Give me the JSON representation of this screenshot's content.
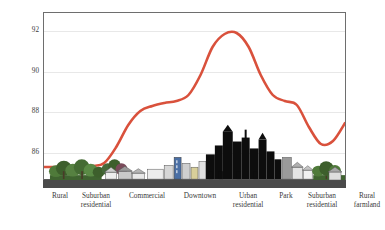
{
  "chart_data": {
    "type": "line",
    "title": "",
    "xlabel": "",
    "ylabel": "Late afternoon temperature (°F)",
    "ylim": [
      84.2,
      92.9
    ],
    "yticks": [
      86,
      88,
      90,
      92
    ],
    "ytick_labels": [
      "86",
      "88",
      "90",
      "92"
    ],
    "grid": true,
    "legend": "none",
    "line_color": "#d9513c",
    "categories": [
      "Rural",
      "Suburban residential",
      "Commercial",
      "Downtown",
      "Urban residential",
      "Park",
      "Suburban residential",
      "Rural farmland"
    ],
    "values": [
      85.2,
      88.3,
      88.6,
      91.9,
      88.5,
      86.3,
      88.1,
      85.2
    ],
    "series": [
      {
        "name": "Late afternoon temperature",
        "x": [
          0,
          4,
          8,
          12,
          16,
          20,
          24,
          28,
          32,
          36,
          40,
          44,
          48,
          52,
          56,
          60,
          64,
          68,
          72,
          76,
          80,
          84,
          88,
          92,
          96,
          100
        ],
        "values": [
          85.2,
          85.2,
          85.2,
          85.2,
          85.25,
          85.4,
          86.2,
          87.3,
          88.0,
          88.25,
          88.4,
          88.5,
          88.8,
          89.8,
          91.2,
          91.85,
          91.9,
          91.2,
          89.8,
          88.8,
          88.5,
          88.3,
          87.2,
          86.35,
          86.5,
          87.4
        ]
      }
    ],
    "annotations": {
      "illustration": "street-profile cross-section: rural trees, suburban houses, commercial low-rise, downtown skyline silhouette, urban residential, park trees, suburban houses, rural farmland hills"
    }
  },
  "axis": {
    "y_title": "Late afternoon temperature (°F)",
    "y_ticks": [
      {
        "label": "92",
        "value": 92
      },
      {
        "label": "90",
        "value": 90
      },
      {
        "label": "88",
        "value": 88
      },
      {
        "label": "86",
        "value": 86
      }
    ]
  },
  "x_categories": [
    {
      "line1": "Rural",
      "line2": ""
    },
    {
      "line1": "Suburban",
      "line2": "residential"
    },
    {
      "line1": "Commercial",
      "line2": ""
    },
    {
      "line1": "Downtown",
      "line2": ""
    },
    {
      "line1": "Urban",
      "line2": "residential"
    },
    {
      "line1": "Park",
      "line2": ""
    },
    {
      "line1": "Suburban",
      "line2": "residential"
    },
    {
      "line1": "Rural",
      "line2": "farmland"
    }
  ],
  "colors": {
    "line": "#d9513c",
    "frame": "#6e6e6e",
    "grid": "#e8e8e8",
    "text": "#3a3a3a",
    "ground": "#4a4a4a",
    "tree_foliage": "#4f7a3a",
    "tree_dark": "#3d5f2c",
    "skyline": "#0d0d0d",
    "building_gray": "#b9b9b9",
    "building_light": "#e2e2e2",
    "building_blue": "#4a6fa5",
    "roof_red": "#9e3b36",
    "farmland_green": "#5c8c46"
  }
}
